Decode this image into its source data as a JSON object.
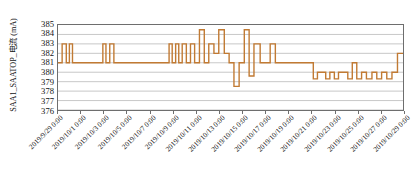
{
  "chart_data": {
    "type": "line",
    "title": "",
    "subtitle": "",
    "xlabel": "",
    "ylabel": "SAA1_SAATOP_电流 (mA)",
    "ylim": [
      376,
      385
    ],
    "ytick_labels": [
      "385",
      "384",
      "383",
      "382",
      "381",
      "380",
      "379",
      "378",
      "377",
      "376"
    ],
    "ytick_values": [
      385,
      384,
      383,
      382,
      381,
      380,
      379,
      378,
      377,
      376
    ],
    "xlim": [
      "2019/9/29 0:00",
      "2019/10/30 0:00"
    ],
    "xtick_labels": [
      "2019/9/29 0:00",
      "2019/10/1 0:00",
      "2019/10/3 0:00",
      "2019/10/5 0:00",
      "2019/10/7 0:00",
      "2019/10/9 0:00",
      "2019/10/11 0:00",
      "2019/10/13 0:00",
      "2019/10/15 0:00",
      "2019/10/17 0:00",
      "2019/10/19 0:00",
      "2019/10/21 0:00",
      "2019/10/23 0:00",
      "2019/10/25 0:00",
      "2019/10/27 0:00",
      "2019/10/29 0:00"
    ],
    "grid": true,
    "legend": false,
    "series": [
      {
        "name": "SAA1_SAATOP_电流",
        "color": "#C17A33",
        "line_width": 1.4,
        "x": [
          0.0,
          1.2,
          1.2,
          2.4,
          2.4,
          3.3,
          3.3,
          4.2,
          4.2,
          5.2,
          5.2,
          13.0,
          13.0,
          13.9,
          13.9,
          15.0,
          15.0,
          16.2,
          16.2,
          17.3,
          17.3,
          32.2,
          32.2,
          33.1,
          33.1,
          34.1,
          34.1,
          35.0,
          35.0,
          36.0,
          36.0,
          37.2,
          37.2,
          38.4,
          38.4,
          39.6,
          39.6,
          41.0,
          41.0,
          42.4,
          42.4,
          43.7,
          43.7,
          45.2,
          45.2,
          46.6,
          46.6,
          48.2,
          48.2,
          49.6,
          49.6,
          51.0,
          51.0,
          52.5,
          52.5,
          54.0,
          54.0,
          55.4,
          55.4,
          56.8,
          56.8,
          58.6,
          58.6,
          60.0,
          60.0,
          61.5,
          61.5,
          63.0,
          63.0,
          64.5,
          64.5,
          66.2,
          66.2,
          68.0,
          68.0,
          70.0,
          70.0,
          74.0,
          74.0,
          75.2,
          75.2,
          77.6,
          77.6,
          78.8,
          78.8,
          80.1,
          80.1,
          81.3,
          81.3,
          82.6,
          82.6,
          84.0,
          84.0,
          85.3,
          85.3,
          86.6,
          86.6,
          88.0,
          88.0,
          89.4,
          89.4,
          91.0,
          91.0,
          92.4,
          92.4,
          93.8,
          93.8,
          95.3,
          95.3,
          96.8,
          96.8,
          98.4,
          98.4,
          100.0
        ],
        "y": [
          381.0,
          381.0,
          383.0,
          383.0,
          381.0,
          381.0,
          383.0,
          383.0,
          381.0,
          381.0,
          381.0,
          381.0,
          383.0,
          383.0,
          381.0,
          381.0,
          383.0,
          383.0,
          381.0,
          381.0,
          381.0,
          381.0,
          383.0,
          383.0,
          381.0,
          381.0,
          383.0,
          383.0,
          381.0,
          381.0,
          383.0,
          383.0,
          381.0,
          381.0,
          383.0,
          383.0,
          381.0,
          381.0,
          384.5,
          384.5,
          381.0,
          381.0,
          383.0,
          383.0,
          382.0,
          382.0,
          384.5,
          384.5,
          382.0,
          382.0,
          381.0,
          381.0,
          378.5,
          378.5,
          381.0,
          381.0,
          384.5,
          384.5,
          379.6,
          379.6,
          383.0,
          383.0,
          381.0,
          381.0,
          381.0,
          381.0,
          383.0,
          383.0,
          381.0,
          381.0,
          381.0,
          381.0,
          381.0,
          381.0,
          381.0,
          381.0,
          381.0,
          381.0,
          379.3,
          379.3,
          380.0,
          380.0,
          379.3,
          379.3,
          380.0,
          380.0,
          379.3,
          379.3,
          380.0,
          380.0,
          380.0,
          380.0,
          379.3,
          379.3,
          381.0,
          381.0,
          379.3,
          379.3,
          380.0,
          380.0,
          379.3,
          379.3,
          380.0,
          380.0,
          379.3,
          379.3,
          380.0,
          380.0,
          379.3,
          379.3,
          380.0,
          380.0,
          382.0,
          382.0
        ]
      }
    ]
  },
  "axis": {
    "frame_color": "#6e6e6e",
    "grid_color": "#b9b9b9",
    "series_color": "#C17A33",
    "background": "#ffffff"
  }
}
